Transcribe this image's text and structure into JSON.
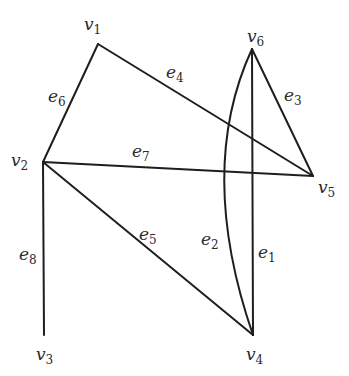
{
  "graph": {
    "vertices": [
      {
        "id": "v1",
        "base": "v",
        "sub": "1",
        "x": 98,
        "y": 44,
        "lx": 84,
        "ly": 30
      },
      {
        "id": "v2",
        "base": "v",
        "sub": "2",
        "x": 43,
        "y": 162,
        "lx": 11,
        "ly": 166
      },
      {
        "id": "v3",
        "base": "v",
        "sub": "3",
        "x": 44,
        "y": 335,
        "lx": 36,
        "ly": 360
      },
      {
        "id": "v4",
        "base": "v",
        "sub": "4",
        "x": 253,
        "y": 335,
        "lx": 246,
        "ly": 360
      },
      {
        "id": "v5",
        "base": "v",
        "sub": "5",
        "x": 313,
        "y": 176,
        "lx": 318,
        "ly": 193
      },
      {
        "id": "v6",
        "base": "v",
        "sub": "6",
        "x": 252,
        "y": 49,
        "lx": 247,
        "ly": 42
      }
    ],
    "edges": [
      {
        "id": "e1",
        "base": "e",
        "sub": "1",
        "from": "v6",
        "to": "v4",
        "curved": false,
        "lx": 258,
        "ly": 258
      },
      {
        "id": "e2",
        "base": "e",
        "sub": "2",
        "from": "v6",
        "to": "v4",
        "curved": true,
        "lx": 201,
        "ly": 245
      },
      {
        "id": "e3",
        "base": "e",
        "sub": "3",
        "from": "v6",
        "to": "v5",
        "curved": false,
        "lx": 284,
        "ly": 101
      },
      {
        "id": "e4",
        "base": "e",
        "sub": "4",
        "from": "v1",
        "to": "v5",
        "curved": false,
        "lx": 166,
        "ly": 78
      },
      {
        "id": "e5",
        "base": "e",
        "sub": "5",
        "from": "v2",
        "to": "v4",
        "curved": false,
        "lx": 139,
        "ly": 240
      },
      {
        "id": "e6",
        "base": "e",
        "sub": "6",
        "from": "v1",
        "to": "v2",
        "curved": false,
        "lx": 48,
        "ly": 102
      },
      {
        "id": "e7",
        "base": "e",
        "sub": "7",
        "from": "v2",
        "to": "v5",
        "curved": false,
        "lx": 132,
        "ly": 157
      },
      {
        "id": "e8",
        "base": "e",
        "sub": "8",
        "from": "v2",
        "to": "v3",
        "curved": false,
        "lx": 19,
        "ly": 260
      }
    ]
  },
  "colors": {
    "line": "#1e1e1e",
    "text": "#2a2a2a",
    "background": "#ffffff"
  }
}
